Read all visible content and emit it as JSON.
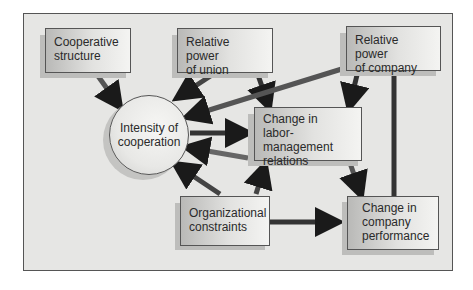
{
  "diagram": {
    "nodes": {
      "cooperative_structure": "Cooperative\nstructure",
      "relative_power_union": "Relative power\nof union",
      "relative_power_company": "Relative power\nof company",
      "intensity_of_cooperation": "Intensity of\ncooperation",
      "change_labor_management": "Change in\nlabor-management\nrelations",
      "organizational_constraints": "Organizational\nconstraints",
      "change_company_performance": "Change in\ncompany\nperformance"
    },
    "edges": [
      {
        "from": "Cooperative structure",
        "to": "Intensity of cooperation"
      },
      {
        "from": "Relative power of union",
        "to": "Intensity of cooperation"
      },
      {
        "from": "Relative power of union",
        "to": "Change in labor-management relations"
      },
      {
        "from": "Relative power of company",
        "to": "Intensity of cooperation"
      },
      {
        "from": "Relative power of company",
        "to": "Change in labor-management relations"
      },
      {
        "from": "Relative power of company",
        "to": "Change in company performance"
      },
      {
        "from": "Intensity of cooperation",
        "to": "Change in labor-management relations"
      },
      {
        "from": "Change in labor-management relations",
        "to": "Intensity of cooperation"
      },
      {
        "from": "Change in labor-management relations",
        "to": "Change in company performance"
      },
      {
        "from": "Organizational constraints",
        "to": "Intensity of cooperation"
      },
      {
        "from": "Organizational constraints",
        "to": "Change in labor-management relations"
      },
      {
        "from": "Organizational constraints",
        "to": "Change in company performance"
      }
    ]
  }
}
